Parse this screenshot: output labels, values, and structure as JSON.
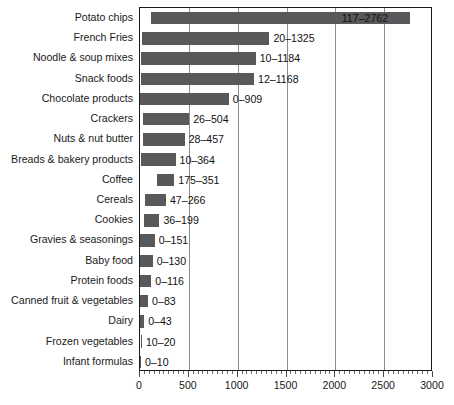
{
  "chart_data": {
    "type": "bar",
    "orientation": "horizontal",
    "title": "",
    "subtitle": "",
    "xlabel": "",
    "ylabel": "",
    "xlim": [
      0,
      3000
    ],
    "grid": true,
    "legend": null,
    "bar_color": "#59595b",
    "axis_color": "#1a1a1a",
    "gridline_color": "#8d8d8f",
    "value_label_note": "each bar spans from its minimum to its maximum value; the label shows 'min–max'",
    "x_ticks": [
      0,
      500,
      1000,
      1500,
      2000,
      2500,
      3000
    ],
    "x_tick_labels": [
      "0",
      "500",
      "1000",
      "1500",
      "2000",
      "2500",
      "3000"
    ],
    "x_minor_tick_step": 50,
    "categories": [
      "Potato chips",
      "French Fries",
      "Noodle & soup mixes",
      "Snack foods",
      "Chocolate products",
      "Crackers",
      "Nuts & nut butter",
      "Breads & bakery products",
      "Coffee",
      "Cereals",
      "Cookies",
      "Gravies & seasonings",
      "Baby food",
      "Protein foods",
      "Canned fruit & vegetables",
      "Dairy",
      "Frozen vegetables",
      "Infant formulas"
    ],
    "mins": [
      117,
      20,
      10,
      12,
      0,
      26,
      28,
      10,
      175,
      47,
      36,
      0,
      0,
      0,
      0,
      0,
      10,
      0
    ],
    "maxs": [
      2762,
      1325,
      1184,
      1168,
      909,
      504,
      457,
      364,
      351,
      266,
      199,
      151,
      130,
      116,
      83,
      43,
      20,
      10
    ],
    "value_labels": [
      "117–2762",
      "20–1325",
      "10–1184",
      "12–1168",
      "0–909",
      "26–504",
      "28–457",
      "10–364",
      "175–351",
      "47–266",
      "36–199",
      "0–151",
      "0–130",
      "0–116",
      "0–83",
      "0–43",
      "10–20",
      "0–10"
    ],
    "label_inside_bar": [
      true,
      false,
      false,
      false,
      false,
      false,
      false,
      false,
      false,
      false,
      false,
      false,
      false,
      false,
      false,
      false,
      false,
      false
    ]
  }
}
